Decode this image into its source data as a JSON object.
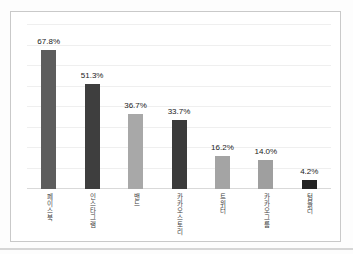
{
  "chart_data": {
    "type": "bar",
    "title": "",
    "xlabel": "",
    "ylabel": "",
    "categories": [
      "페이스북",
      "인스타그램",
      "밴드",
      "카카오스토리",
      "트위터",
      "카카오그룹",
      "텀블러"
    ],
    "values": [
      67.8,
      51.3,
      36.7,
      33.7,
      16.2,
      14.0,
      4.2
    ],
    "value_labels": [
      "67.8%",
      "51.3%",
      "36.7%",
      "33.7%",
      "16.2%",
      "14.0%",
      "4.2%"
    ],
    "bar_colors": [
      "#5d5d5d",
      "#3e3e3e",
      "#a8a8a8",
      "#3b3b3b",
      "#a4a4a4",
      "#9f9f9f",
      "#232323"
    ],
    "ylim": [
      0,
      80
    ],
    "gridline_step": 10,
    "grid": true,
    "legend": "none",
    "data_labels": true,
    "category_label_orientation": "vertical-stacked"
  },
  "frame": {
    "border_color": "#c9c9c9",
    "background": "#ffffff",
    "gridline_color": "#efefef",
    "baseline_color": "#d9d9d9",
    "page_edge_color": "#d6d6d6"
  }
}
